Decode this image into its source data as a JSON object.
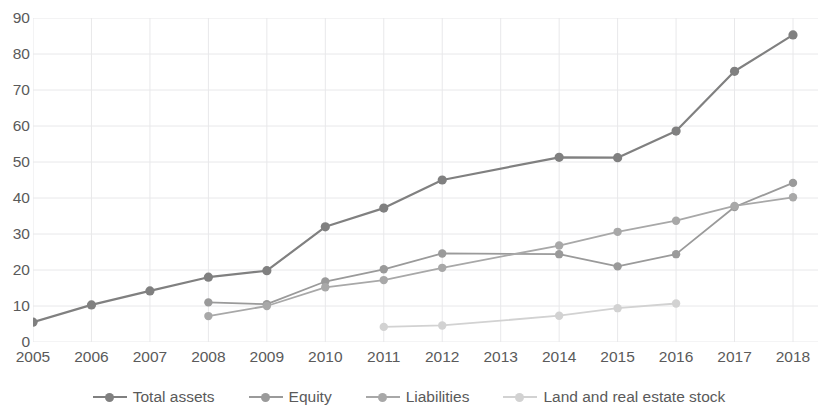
{
  "chart_data": {
    "type": "line",
    "title": "",
    "subtitle": "",
    "xlabel": "",
    "ylabel": "",
    "x": [
      2005,
      2006,
      2007,
      2008,
      2009,
      2010,
      2011,
      2012,
      2013,
      2014,
      2015,
      2016,
      2017,
      2018
    ],
    "categories": [
      "2005",
      "2006",
      "2007",
      "2008",
      "2009",
      "2010",
      "2011",
      "2012",
      "2013",
      "2014",
      "2015",
      "2016",
      "2017",
      "2018"
    ],
    "ylim": [
      0,
      90
    ],
    "yticks": [
      0,
      10,
      20,
      30,
      40,
      50,
      60,
      70,
      80,
      90
    ],
    "ytick_labels": [
      "0",
      "10",
      "20",
      "30",
      "40",
      "50",
      "60",
      "70",
      "80",
      "90"
    ],
    "grid": true,
    "grid_axis": "both",
    "legend_position": "bottom",
    "series": [
      {
        "name": "Total assets",
        "color": "#808080",
        "marker": "circle",
        "values": [
          5.5,
          10.3,
          14.2,
          18.0,
          19.8,
          32.0,
          37.2,
          45.0,
          null,
          51.3,
          51.2,
          58.6,
          75.2,
          85.3
        ],
        "markers_at": [
          2005,
          2006,
          2007,
          2008,
          2009,
          2010,
          2011,
          2012,
          2014,
          2015,
          2016,
          2017,
          2018
        ]
      },
      {
        "name": "Equity",
        "color": "#9a9a9a",
        "marker": "circle",
        "values": [
          null,
          null,
          null,
          11.0,
          10.5,
          16.8,
          20.2,
          24.6,
          null,
          24.4,
          21.0,
          24.4,
          37.5,
          44.2
        ],
        "markers_at": [
          2008,
          2009,
          2010,
          2011,
          2012,
          2014,
          2015,
          2016,
          2017,
          2018
        ]
      },
      {
        "name": "Liabilities",
        "color": "#a8a8a8",
        "marker": "circle",
        "values": [
          null,
          null,
          null,
          7.2,
          10.0,
          15.2,
          17.2,
          20.6,
          null,
          26.8,
          30.6,
          33.7,
          37.8,
          40.2
        ],
        "markers_at": [
          2008,
          2009,
          2010,
          2011,
          2012,
          2014,
          2015,
          2016,
          2017,
          2018
        ]
      },
      {
        "name": "Land and real estate stock",
        "color": "#d2d2d2",
        "marker": "circle",
        "values": [
          null,
          null,
          null,
          null,
          null,
          null,
          4.2,
          4.6,
          null,
          7.3,
          9.4,
          10.7,
          null,
          null
        ],
        "markers_at": [
          2011,
          2012,
          2014,
          2015,
          2016
        ]
      }
    ]
  },
  "axes": {
    "y_ticks": [
      "90",
      "80",
      "70",
      "60",
      "50",
      "40",
      "30",
      "20",
      "10",
      "0"
    ],
    "x_ticks": [
      "2005",
      "2006",
      "2007",
      "2008",
      "2009",
      "2010",
      "2011",
      "2012",
      "2013",
      "2014",
      "2015",
      "2016",
      "2017",
      "2018"
    ]
  },
  "legend": {
    "items": [
      {
        "label": "Total assets",
        "color": "#808080"
      },
      {
        "label": "Equity",
        "color": "#9a9a9a"
      },
      {
        "label": "Liabilities",
        "color": "#a8a8a8"
      },
      {
        "label": "Land and real estate stock",
        "color": "#d2d2d2"
      }
    ]
  },
  "colors": {
    "background": "#ffffff",
    "grid": "#e8e8ea",
    "text": "#5a5a5a"
  }
}
